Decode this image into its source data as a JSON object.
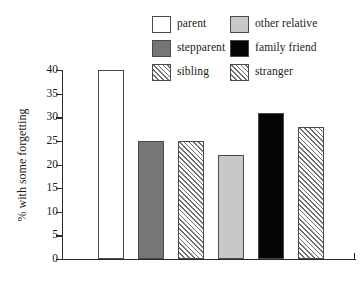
{
  "chart_data": {
    "type": "bar",
    "title": "",
    "xlabel": "",
    "ylabel": "% with some forgetting",
    "ylim": [
      0,
      40
    ],
    "yticks": [
      0,
      5,
      10,
      15,
      20,
      25,
      30,
      35,
      40
    ],
    "ytick_labels": [
      "0",
      "5",
      "10",
      "15",
      "20",
      "25",
      "30",
      "35",
      "40"
    ],
    "grid": false,
    "legend_position": "top-center",
    "categories": [
      "parent",
      "stepparent",
      "sibling",
      "other relative",
      "family friend",
      "stranger"
    ],
    "values": [
      40,
      25,
      25,
      22,
      31,
      28
    ],
    "series": [
      {
        "name": "% with some forgetting",
        "values": [
          40,
          25,
          25,
          22,
          31,
          28
        ]
      }
    ],
    "bars": [
      {
        "label": "parent",
        "value": 40,
        "style": "white",
        "color": "#ffffff"
      },
      {
        "label": "stepparent",
        "value": 25,
        "style": "darkgray",
        "color": "#767676"
      },
      {
        "label": "sibling",
        "value": 25,
        "style": "hatch",
        "color": "#6e6e6e"
      },
      {
        "label": "other relative",
        "value": 22,
        "style": "lightgray",
        "color": "#c8c8c8"
      },
      {
        "label": "family friend",
        "value": 31,
        "style": "black",
        "color": "#050505"
      },
      {
        "label": "stranger",
        "value": 28,
        "style": "hatch",
        "color": "#6e6e6e"
      }
    ]
  },
  "legend": {
    "items": [
      {
        "label": "parent",
        "style": "white"
      },
      {
        "label": "other relative",
        "style": "lightgray"
      },
      {
        "label": "stepparent",
        "style": "darkgray"
      },
      {
        "label": "family friend",
        "style": "black"
      },
      {
        "label": "sibling",
        "style": "hatch"
      },
      {
        "label": "stranger",
        "style": "hatch"
      }
    ]
  },
  "axis": {
    "y_title": "% with some forgetting"
  }
}
